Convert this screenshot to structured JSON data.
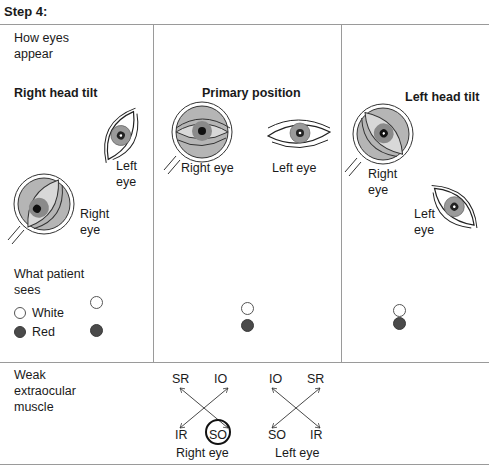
{
  "step_title": "Step 4:",
  "rows": {
    "how_eyes_appear": "How eyes appear",
    "how_eyes_appear_l1": "How eyes",
    "how_eyes_appear_l2": "appear",
    "what_patient_sees_l1": "What patient",
    "what_patient_sees_l2": "sees",
    "weak_muscle_l1": "Weak",
    "weak_muscle_l2": "extraocular",
    "weak_muscle_l3": "muscle"
  },
  "legend": {
    "white": "White",
    "red": "Red"
  },
  "columns": {
    "right_tilt": {
      "title": "Right head tilt",
      "left_eye_l1": "Left",
      "left_eye_l2": "eye",
      "right_eye_l1": "Right",
      "right_eye_l2": "eye"
    },
    "primary": {
      "title": "Primary position",
      "right_eye": "Right eye",
      "left_eye": "Left eye"
    },
    "left_tilt": {
      "title": "Left head tilt",
      "right_eye_l1": "Right",
      "right_eye_l2": "eye",
      "left_eye_l1": "Left",
      "left_eye_l2": "eye"
    }
  },
  "muscles": {
    "right_eye": {
      "label": "Right eye",
      "top_left": "SR",
      "top_right": "IO",
      "bottom_left": "IR",
      "bottom_right": "SO",
      "weak": "SO"
    },
    "left_eye": {
      "label": "Left eye",
      "top_left": "IO",
      "top_right": "SR",
      "bottom_left": "SO",
      "bottom_right": "IR"
    }
  },
  "colors": {
    "magnifier_fill": "#b5b5b5",
    "red_dot": "#4a4a4a",
    "divider": "#9a9a9a"
  }
}
